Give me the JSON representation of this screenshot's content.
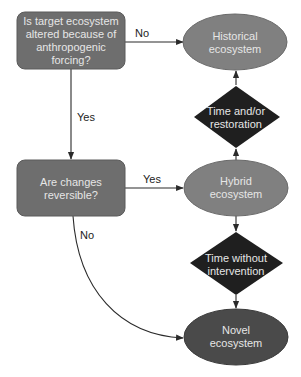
{
  "colors": {
    "box_fill": "#6e6e6e",
    "box_stroke": "#5a5a5a",
    "ellipse_light_fill": "#808080",
    "ellipse_light_stroke": "#6a6a6a",
    "ellipse_dark_fill": "#4a4a4a",
    "diamond_fill": "#1f1f1f",
    "edge": "#2a2a2a",
    "node_text": "#e6e6e6"
  },
  "nodes": {
    "question_altered": {
      "shape": "rounded-rect",
      "lines": [
        "Is target ecosystem",
        "altered because of",
        "anthropogenic",
        "forcing?"
      ]
    },
    "question_reversible": {
      "shape": "rounded-rect",
      "lines": [
        "Are changes",
        "reversible?"
      ]
    },
    "historical": {
      "shape": "ellipse",
      "lines": [
        "Historical",
        "ecosystem"
      ]
    },
    "time_restoration": {
      "shape": "diamond",
      "lines": [
        "Time and/or",
        "restoration"
      ]
    },
    "hybrid": {
      "shape": "ellipse",
      "lines": [
        "Hybrid",
        "ecosystem"
      ]
    },
    "time_without": {
      "shape": "diamond",
      "lines": [
        "Time without",
        "intervention"
      ]
    },
    "novel": {
      "shape": "ellipse",
      "lines": [
        "Novel",
        "ecosystem"
      ]
    }
  },
  "edges": [
    {
      "from": "question_altered",
      "to": "historical",
      "label": "No"
    },
    {
      "from": "question_altered",
      "to": "question_reversible",
      "label": "Yes"
    },
    {
      "from": "question_reversible",
      "to": "hybrid",
      "label": "Yes"
    },
    {
      "from": "question_reversible",
      "to": "novel",
      "label": "No"
    },
    {
      "from": "hybrid",
      "to": "time_restoration",
      "label": ""
    },
    {
      "from": "time_restoration",
      "to": "historical",
      "label": ""
    },
    {
      "from": "hybrid",
      "to": "time_without",
      "label": ""
    },
    {
      "from": "time_without",
      "to": "novel",
      "label": ""
    }
  ]
}
